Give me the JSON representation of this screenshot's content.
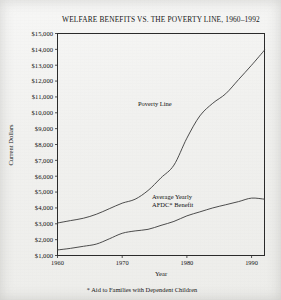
{
  "chart_data": {
    "type": "line",
    "title": "WELFARE BENEFITS VS. THE POVERTY LINE, 1960–1992",
    "xlabel": "Year",
    "ylabel": "Current Dollars",
    "xlim": [
      1960,
      1992
    ],
    "ylim": [
      1000,
      15000
    ],
    "grid": false,
    "legend_position": "inline-annotation",
    "xticks": [
      1960,
      1970,
      1980,
      1990
    ],
    "xtick_labels": [
      "1960",
      "1970",
      "1980",
      "1990"
    ],
    "yticks": [
      1000,
      2000,
      3000,
      4000,
      5000,
      6000,
      7000,
      8000,
      9000,
      10000,
      11000,
      12000,
      13000,
      14000,
      15000
    ],
    "ytick_labels": [
      "$1,000",
      "$2,000",
      "$3,000",
      "$4,000",
      "$5,000",
      "$6,000",
      "$7,000",
      "$8,000",
      "$9,000",
      "$10,000",
      "$11,000",
      "$12,000",
      "$13,000",
      "$14,000",
      "$15,000"
    ],
    "footnote": "* Aid to Families with Dependent Children",
    "series": [
      {
        "name": "Poverty Line",
        "label_line1": "Poverty Line",
        "label_line2": "",
        "x": [
          1960,
          1962,
          1964,
          1966,
          1968,
          1970,
          1972,
          1974,
          1976,
          1978,
          1980,
          1982,
          1984,
          1986,
          1988,
          1990,
          1992
        ],
        "values": [
          3050,
          3200,
          3350,
          3600,
          3950,
          4300,
          4550,
          5100,
          5900,
          6700,
          8400,
          9800,
          10600,
          11200,
          12100,
          13000,
          13950
        ]
      },
      {
        "name": "Average Yearly AFDC Benefit",
        "label_line1": "Average Yearly",
        "label_line2": "AFDC* Benefit",
        "x": [
          1960,
          1962,
          1964,
          1966,
          1968,
          1970,
          1972,
          1974,
          1976,
          1978,
          1980,
          1982,
          1984,
          1986,
          1988,
          1990,
          1992
        ],
        "values": [
          1350,
          1450,
          1580,
          1720,
          2050,
          2400,
          2550,
          2650,
          2900,
          3150,
          3500,
          3750,
          4000,
          4200,
          4400,
          4620,
          4550
        ]
      }
    ]
  },
  "annotations": {
    "poverty_label": "Poverty Line",
    "afdc_label_line1": "Average Yearly",
    "afdc_label_line2": "AFDC* Benefit"
  }
}
